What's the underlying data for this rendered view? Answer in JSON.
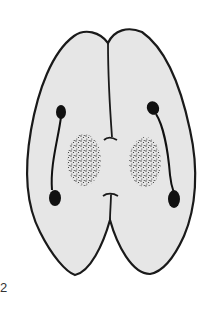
{
  "figure": {
    "label": "2",
    "colors": {
      "outline": "#1a1a1a",
      "fill": "#e6e6e6",
      "stipple": "#2a2a2a",
      "background": "#ffffff"
    },
    "parts": [
      {
        "name": "left-lobe"
      },
      {
        "name": "right-lobe"
      },
      {
        "name": "median-suture"
      },
      {
        "name": "left-duct"
      },
      {
        "name": "right-duct"
      },
      {
        "name": "left-stippled-patch"
      },
      {
        "name": "right-stippled-patch"
      }
    ]
  }
}
